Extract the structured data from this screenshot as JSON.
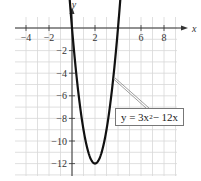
{
  "chart_data": {
    "type": "line",
    "title": "",
    "xlabel": "x",
    "ylabel": "y",
    "xlim": [
      -5,
      9
    ],
    "ylim": [
      -13,
      2
    ],
    "grid": true,
    "x_ticks": [
      -4,
      -2,
      2,
      6,
      8
    ],
    "y_ticks": [
      -2,
      -4,
      -6,
      -8,
      -10,
      -12
    ],
    "series": [
      {
        "name": "y = 3x^2 - 12x",
        "equation": "y = 3x^2 - 12x",
        "x": [
          -0.2,
          0,
          0.5,
          1,
          1.5,
          2,
          2.5,
          3,
          3.5,
          4,
          4.2
        ],
        "y": [
          2.52,
          0,
          -5.25,
          -9,
          -11.25,
          -12,
          -11.25,
          -9,
          -5.25,
          0,
          2.52
        ]
      }
    ],
    "annotations": [
      {
        "text_prefix": "y = 3x",
        "exponent": "2",
        "text_suffix": " − 12x",
        "points_to": [
          3.6,
          -4.5
        ]
      }
    ],
    "colors": {
      "curve": "#111111",
      "grid": "#d8d8d8",
      "axis": "#333333",
      "box_border": "#777777"
    }
  }
}
